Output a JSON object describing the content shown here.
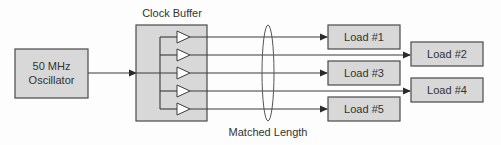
{
  "diagram": {
    "colors": {
      "box_fill": "#d8d8d8",
      "box_stroke": "#4a4a4a",
      "line": "#3a3a3a",
      "text": "#333333",
      "buffer_fill": "#ffffff"
    },
    "oscillator": {
      "line1": "50 MHz",
      "line2": "Oscillator"
    },
    "clock_buffer": {
      "title": "Clock Buffer",
      "buffer_count": 5
    },
    "annotation": {
      "matched_length": "Matched Length"
    },
    "loads": [
      {
        "id": 1,
        "label": "Load #1",
        "column": "near"
      },
      {
        "id": 2,
        "label": "Load #2",
        "column": "far"
      },
      {
        "id": 3,
        "label": "Load #3",
        "column": "near"
      },
      {
        "id": 4,
        "label": "Load #4",
        "column": "far"
      },
      {
        "id": 5,
        "label": "Load #5",
        "column": "near"
      }
    ]
  }
}
